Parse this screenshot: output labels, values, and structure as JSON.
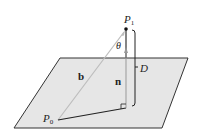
{
  "diagram": {
    "colors": {
      "plane_fill": "#e6e6e6",
      "plane_edge": "#333333",
      "vector_b": "#bdbdbd",
      "ink": "#222222"
    },
    "labels": {
      "p1": "P",
      "p1_sub": "1",
      "p0": "P",
      "p0_sub": "0",
      "theta": "θ",
      "b": "b",
      "n": "n",
      "d": "D"
    }
  }
}
